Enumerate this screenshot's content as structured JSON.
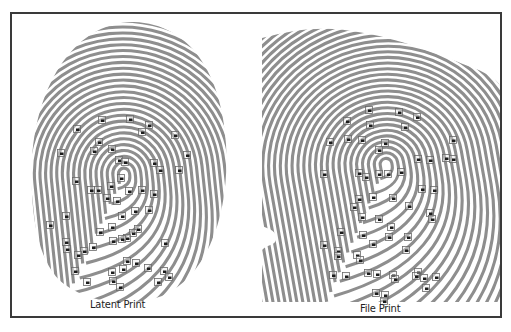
{
  "figure": {
    "panels": [
      {
        "id": "latent",
        "caption": "Latent Print",
        "marker_count": 48
      },
      {
        "id": "file",
        "caption": "File Print",
        "marker_count": 52
      }
    ],
    "colors": {
      "ridge": "#8e8e8e",
      "background": "#ffffff",
      "frame": "#3a3a3a",
      "marker": "#1c1c1c"
    }
  }
}
